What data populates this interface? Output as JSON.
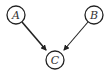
{
  "diagram": {
    "type": "directed-graph",
    "nodes": [
      {
        "id": "A",
        "label": "A",
        "cx": 16,
        "cy": 15
      },
      {
        "id": "B",
        "label": "B",
        "cx": 94,
        "cy": 15
      },
      {
        "id": "C",
        "label": "C",
        "cx": 55,
        "cy": 60
      }
    ],
    "edges": [
      {
        "from": "A",
        "to": "C"
      },
      {
        "from": "B",
        "to": "C"
      }
    ],
    "colors": {
      "stroke": "#222222",
      "background": "#ffffff"
    }
  }
}
